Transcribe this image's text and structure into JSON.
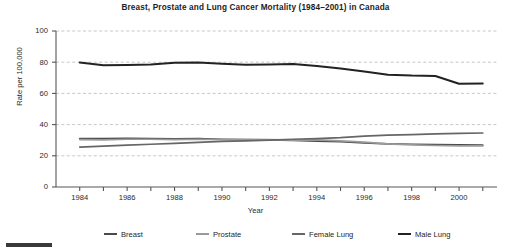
{
  "chart_data": {
    "type": "line",
    "title": "Breast, Prostate and Lung Cancer Mortality (1984–2001) in Canada",
    "xlabel": "Year",
    "ylabel": "Rate per 100,000",
    "xlim": [
      1983,
      2001.6
    ],
    "ylim": [
      0,
      100
    ],
    "ytick_values": [
      0,
      20,
      40,
      60,
      80,
      100
    ],
    "ytick_labels": [
      "0",
      "20",
      "40",
      "60",
      "80",
      "100"
    ],
    "xtick_values": [
      1984,
      1985,
      1986,
      1987,
      1988,
      1989,
      1990,
      1991,
      1992,
      1993,
      1994,
      1995,
      1996,
      1997,
      1998,
      1999,
      2000,
      2001
    ],
    "xtick_labels_shown": [
      "1984",
      "1986",
      "1988",
      "1990",
      "1992",
      "1994",
      "1996",
      "1998",
      "2000"
    ],
    "xtick_labels_shown_values": [
      1984,
      1986,
      1988,
      1990,
      1992,
      1994,
      1996,
      1998,
      2000
    ],
    "grid": "horizontal-dashed",
    "legend_position": "bottom",
    "x": [
      1984,
      1985,
      1986,
      1987,
      1988,
      1989,
      1990,
      1991,
      1992,
      1993,
      1994,
      1995,
      1996,
      1997,
      1998,
      1999,
      2000,
      2001
    ],
    "series": [
      {
        "name": "Breast",
        "color": "#4a4a4a",
        "values": [
          31.0,
          31.0,
          31.2,
          31.0,
          30.8,
          31.0,
          30.6,
          30.4,
          30.2,
          29.8,
          29.4,
          29.0,
          28.2,
          27.6,
          27.4,
          27.2,
          27.0,
          26.8
        ]
      },
      {
        "name": "Prostate",
        "color": "#9a9a9a",
        "values": [
          30.4,
          30.2,
          30.6,
          30.6,
          30.4,
          30.6,
          30.4,
          30.4,
          30.4,
          30.0,
          30.2,
          29.6,
          28.8,
          27.6,
          27.0,
          26.6,
          26.4,
          26.4
        ]
      },
      {
        "name": "Female Lung",
        "color": "#666666",
        "values": [
          25.6,
          26.2,
          26.8,
          27.4,
          28.0,
          28.6,
          29.2,
          29.6,
          30.0,
          30.6,
          31.0,
          31.6,
          32.6,
          33.2,
          33.6,
          34.0,
          34.4,
          34.6
        ]
      },
      {
        "name": "Male Lung",
        "color": "#222222",
        "values": [
          79.8,
          78.0,
          78.2,
          78.6,
          79.6,
          79.8,
          79.0,
          78.4,
          78.6,
          78.8,
          77.6,
          76.0,
          74.0,
          72.0,
          71.4,
          71.2,
          66.2,
          66.4
        ]
      }
    ]
  },
  "legend": {
    "items": [
      {
        "label": "Breast",
        "color": "#4a4a4a"
      },
      {
        "label": "Prostate",
        "color": "#9a9a9a"
      },
      {
        "label": "Female Lung",
        "color": "#666666"
      },
      {
        "label": "Male Lung",
        "color": "#222222"
      }
    ]
  }
}
